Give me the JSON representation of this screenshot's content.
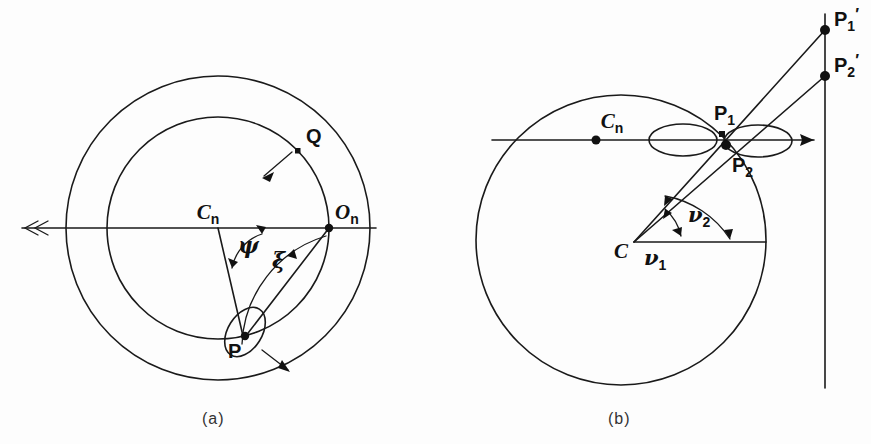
{
  "figure": {
    "background_color": "#fdfdfd",
    "ink_color": "#1a1a1a",
    "width": 871,
    "height": 444
  },
  "panel_a": {
    "caption": "(a)",
    "labels": {
      "center": "C",
      "center_sub": "n",
      "origin": "O",
      "origin_sub": "n",
      "point_p": "P",
      "point_q": "Q",
      "angle_psi": "ψ",
      "angle_xi": "ξ"
    },
    "elements": [
      "outer-circle",
      "inner-circle",
      "horizontal-axis-with-double-arrowhead",
      "radius-cn-to-p",
      "chord-on-to-p",
      "ellipse-at-p",
      "arc-psi",
      "arc-xi",
      "arrow-at-q",
      "arrow-below-p"
    ]
  },
  "panel_b": {
    "caption": "(b)",
    "labels": {
      "center": "C",
      "center_n": "C",
      "center_n_sub": "n",
      "point_p1": "P",
      "point_p1_sub": "1",
      "point_p2": "P",
      "point_p2_sub": "2",
      "point_p1_prime": "P",
      "point_p1_prime_sub": "1",
      "point_p1_prime_mark": "′",
      "point_p2_prime": "P",
      "point_p2_prime_sub": "2",
      "point_p2_prime_mark": "′",
      "angle_nu1": "ν",
      "angle_nu1_sub": "1",
      "angle_nu2": "ν",
      "angle_nu2_sub": "2"
    },
    "elements": [
      "main-circle",
      "horizontal-line-through-cn",
      "horizontal-radius-from-c",
      "ray-c-to-p1-prime",
      "ray-c-to-p2-prime",
      "vertical-screen-line",
      "lobe-ellipse-left",
      "lobe-ellipse-right",
      "arrow-to-screen",
      "arc-nu1",
      "arc-nu2"
    ]
  }
}
